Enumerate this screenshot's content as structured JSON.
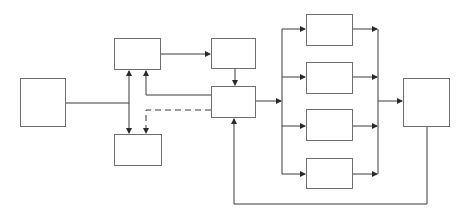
{
  "diagram": {
    "type": "block-diagram",
    "labels_visible": false,
    "stroke_color": "#3a3a3a",
    "box_border_color": "#6e6e6e",
    "background": "#ffffff",
    "nodes": [
      {
        "id": "A",
        "role": "source-block",
        "x": 20,
        "y": 78,
        "w": 46,
        "h": 49
      },
      {
        "id": "B",
        "role": "upper-block",
        "x": 114,
        "y": 38,
        "w": 47,
        "h": 32
      },
      {
        "id": "C",
        "role": "lower-block",
        "x": 114,
        "y": 134,
        "w": 48,
        "h": 32
      },
      {
        "id": "D",
        "role": "top-middle-block",
        "x": 211,
        "y": 38,
        "w": 45,
        "h": 31
      },
      {
        "id": "E",
        "role": "central-block",
        "x": 211,
        "y": 86,
        "w": 45,
        "h": 32
      },
      {
        "id": "P1",
        "role": "parallel-block-1",
        "x": 306,
        "y": 14,
        "w": 47,
        "h": 32
      },
      {
        "id": "P2",
        "role": "parallel-block-2",
        "x": 306,
        "y": 62,
        "w": 47,
        "h": 32
      },
      {
        "id": "P3",
        "role": "parallel-block-3",
        "x": 306,
        "y": 109,
        "w": 47,
        "h": 32
      },
      {
        "id": "P4",
        "role": "parallel-block-4",
        "x": 306,
        "y": 158,
        "w": 47,
        "h": 31
      },
      {
        "id": "F",
        "role": "output-block",
        "x": 403,
        "y": 78,
        "w": 47,
        "h": 49
      }
    ],
    "edges": [
      {
        "from": "A",
        "to": "bus",
        "style": "solid",
        "arrow": "none"
      },
      {
        "from": "bus",
        "to": "B",
        "style": "solid",
        "arrow": "end"
      },
      {
        "from": "bus",
        "to": "C",
        "style": "solid",
        "arrow": "end"
      },
      {
        "from": "B",
        "to": "D",
        "style": "solid",
        "arrow": "end"
      },
      {
        "from": "D",
        "to": "E",
        "style": "solid",
        "arrow": "end"
      },
      {
        "from": "E",
        "to": "B",
        "style": "solid",
        "arrow": "end"
      },
      {
        "from": "E",
        "to": "C",
        "style": "dashed",
        "arrow": "end"
      },
      {
        "from": "E",
        "to": "split",
        "style": "solid",
        "arrow": "end"
      },
      {
        "from": "split",
        "to": "P1",
        "style": "solid",
        "arrow": "end"
      },
      {
        "from": "split",
        "to": "P2",
        "style": "solid",
        "arrow": "end"
      },
      {
        "from": "split",
        "to": "P3",
        "style": "solid",
        "arrow": "end"
      },
      {
        "from": "split",
        "to": "P4",
        "style": "solid",
        "arrow": "end"
      },
      {
        "from": "P1",
        "to": "join",
        "style": "solid",
        "arrow": "end"
      },
      {
        "from": "P2",
        "to": "join",
        "style": "solid",
        "arrow": "end"
      },
      {
        "from": "P3",
        "to": "join",
        "style": "solid",
        "arrow": "end"
      },
      {
        "from": "P4",
        "to": "join",
        "style": "solid",
        "arrow": "end"
      },
      {
        "from": "join",
        "to": "F",
        "style": "solid",
        "arrow": "end"
      },
      {
        "from": "F",
        "to": "E",
        "style": "solid",
        "arrow": "end",
        "kind": "feedback"
      }
    ]
  }
}
